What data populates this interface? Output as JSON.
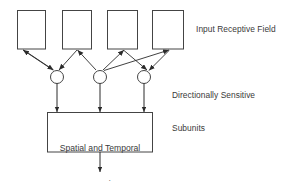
{
  "figure": {
    "background_color": "#ffffff",
    "stroke_color": "#444444",
    "text_color": "#3a3a3a"
  },
  "labels": {
    "input_receptive_field": "Input Receptive Field",
    "directionally_sensitive_line1": "Directionally Sensitive",
    "directionally_sensitive_line2": "Subunits",
    "integration_line1": "Spatial and Temporal",
    "integration_line2": "Integration"
  },
  "nodes": {
    "input_boxes": [
      {
        "id": "input-box-1",
        "x": 17,
        "y": 10,
        "width": 29,
        "height": 39
      },
      {
        "id": "input-box-2",
        "x": 62,
        "y": 10,
        "width": 30,
        "height": 39
      },
      {
        "id": "input-box-3",
        "x": 107,
        "y": 10,
        "width": 31,
        "height": 39
      },
      {
        "id": "input-box-4",
        "x": 152,
        "y": 10,
        "width": 32,
        "height": 39
      }
    ],
    "subunit_circles": [
      {
        "id": "subunit-circle-1",
        "cx": 57,
        "cy": 77,
        "r": 6.5
      },
      {
        "id": "subunit-circle-2",
        "cx": 100,
        "cy": 77,
        "r": 6.5
      },
      {
        "id": "subunit-circle-3",
        "cx": 144,
        "cy": 77,
        "r": 6.5
      }
    ],
    "integration_box": {
      "id": "integration-box",
      "x": 47,
      "y": 112,
      "width": 106,
      "height": 40
    },
    "output_arrow": {
      "id": "output-arrow",
      "x": 100,
      "y_start": 152,
      "y_end": 172
    }
  },
  "edges": {
    "box_to_subunit": [
      {
        "from": "input-box-1",
        "to": "subunit-circle-1",
        "arrow_at": "both"
      },
      {
        "from": "input-box-2",
        "to": "subunit-circle-1",
        "arrow_at": "subunit"
      },
      {
        "from": "input-box-2",
        "to": "subunit-circle-2",
        "arrow_at": "box"
      },
      {
        "from": "input-box-3",
        "to": "subunit-circle-2",
        "arrow_at": "box"
      },
      {
        "from": "input-box-3",
        "to": "subunit-circle-3",
        "arrow_at": "subunit"
      },
      {
        "from": "input-box-4",
        "to": "subunit-circle-2",
        "arrow_at": "subunit"
      },
      {
        "from": "input-box-4",
        "to": "subunit-circle-3",
        "arrow_at": "box"
      }
    ],
    "subunit_to_integration": [
      {
        "from": "subunit-circle-1",
        "to": "integration-box"
      },
      {
        "from": "subunit-circle-2",
        "to": "integration-box"
      },
      {
        "from": "subunit-circle-3",
        "to": "integration-box"
      }
    ]
  }
}
